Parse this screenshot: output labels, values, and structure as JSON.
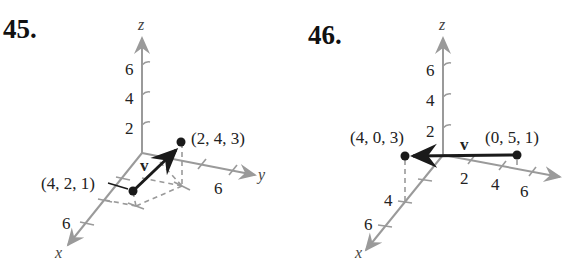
{
  "figures": [
    {
      "number": "45.",
      "axes": {
        "x": "x",
        "y": "y",
        "z": "z"
      },
      "z_ticks": [
        "2",
        "4",
        "6"
      ],
      "y_ticks": [
        "6"
      ],
      "x_ticks": [
        "6"
      ],
      "vector_label": "v",
      "initial_point": "(4, 2, 1)",
      "terminal_point": "(2, 4, 3)"
    },
    {
      "number": "46.",
      "axes": {
        "x": "x",
        "y": "y",
        "z": "z"
      },
      "z_ticks": [
        "2",
        "4",
        "6"
      ],
      "y_ticks": [
        "2",
        "4",
        "6"
      ],
      "x_ticks": [
        "4",
        "6"
      ],
      "vector_label": "v",
      "initial_point": "(0, 5, 1)",
      "terminal_point": "(4, 0, 3)"
    }
  ]
}
